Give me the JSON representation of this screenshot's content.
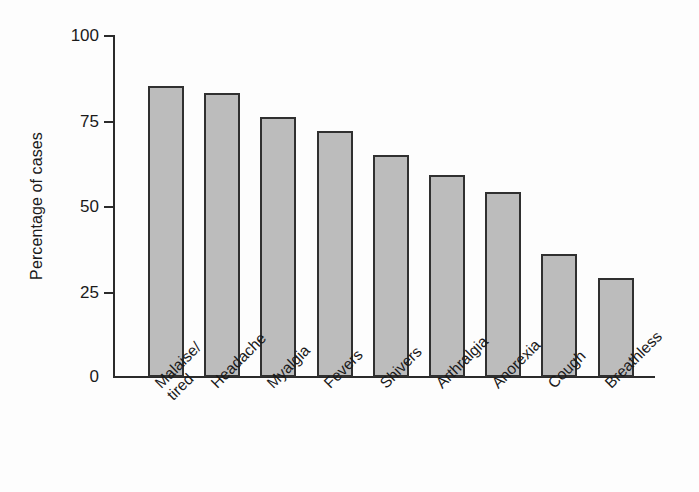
{
  "chart_data": {
    "type": "bar",
    "title": "",
    "subtitle": "",
    "xlabel": "",
    "ylabel": "Percentage of cases",
    "categories": [
      "Malaise/\ntired",
      "Headache",
      "Myalgia",
      "Fevers",
      "Shivers",
      "Arthralgia",
      "Anorexia",
      "Cough",
      "Breathless"
    ],
    "values": [
      85,
      83,
      76,
      72,
      65,
      59,
      54,
      36,
      29
    ],
    "ylim": [
      0,
      100
    ],
    "yticks": [
      0,
      25,
      50,
      75,
      100
    ],
    "ytick_labels": [
      "0",
      "25",
      "50",
      "75",
      "100"
    ],
    "xlim": [
      0,
      9
    ],
    "grid": false,
    "legend": false,
    "legend_position": "none",
    "bar_fill_color": "#bcbcbc",
    "bar_edge_color": "#303030",
    "axis_color": "#2b2b2b",
    "background_color": "#fdfdfd",
    "text_color": "#1a1a1a",
    "xtick_label_rotation": -45
  }
}
